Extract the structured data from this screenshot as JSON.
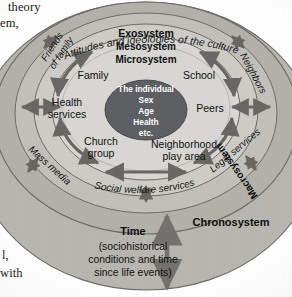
{
  "figure": {
    "type": "bronfenbrenner-ecological-systems-model",
    "center": {
      "lines": [
        "The individual",
        "Sex",
        "Age",
        "Health",
        "etc."
      ],
      "fill_color": "#5f6063",
      "text_color": "#ffffff"
    },
    "rings": [
      {
        "id": "microsystem",
        "label": "Microsystem",
        "fill_color": "#d9d8d4",
        "members": [
          "Family",
          "School",
          "Health services",
          "Peers",
          "Church group",
          "Neighborhood play area"
        ]
      },
      {
        "id": "mesosystem",
        "label": "Mesosystem",
        "fill_color": "#cfcdc8",
        "members": [
          "Friends of family",
          "Neighbors",
          "Mass media",
          "Legal services",
          "Social welfare services"
        ]
      },
      {
        "id": "exosystem",
        "label": "Exosystem",
        "fill_color": "#c3c1bb"
      },
      {
        "id": "macrosystem",
        "label": "Macrosystem",
        "arc_label": "Attitudes and ideologies of the culture",
        "fill_color": "#b4b2ab"
      },
      {
        "id": "chronosystem",
        "label": "Chronosystem",
        "fill_color": "#b9b7b1"
      }
    ],
    "chronosystem": {
      "label": "Chronosystem",
      "time_label": "Time",
      "time_description": [
        "(sociohistorical",
        "conditions and time",
        "since life events)"
      ]
    },
    "labels": {
      "family": "Family",
      "school": "School",
      "health_services_line1": "Health",
      "health_services_line2": "services",
      "peers": "Peers",
      "church_group_line1": "Church",
      "church_group_line2": "group",
      "neighborhood_line1": "Neighborhood",
      "neighborhood_line2": "play area",
      "friends_of_family_line1": "Friends",
      "friends_of_family_line2": "of family",
      "neighbors": "Neighbors",
      "mass_media": "Mass media",
      "legal_services": "Legal services",
      "social_welfare": "Social welfare services",
      "macrosystem": "Macrosystem",
      "exosystem": "Exosystem",
      "mesosystem": "Mesosystem",
      "microsystem": "Microsystem",
      "culture_arc": "Attitudes and ideologies of the culture"
    }
  },
  "margin_text": {
    "line1": "theory",
    "line2": "em,",
    "line3": "l,",
    "line4": "with"
  },
  "colors": {
    "page_background": "#ffffff",
    "ring_outline": "#6e6c68",
    "arrow_color": "#6a6864",
    "text_dark": "#161616",
    "center_fill": "#5f6063"
  }
}
